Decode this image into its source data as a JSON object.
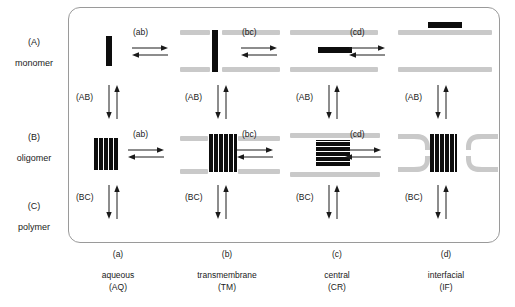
{
  "figure": {
    "colors": {
      "protein": "#0d0d0d",
      "membrane": "#c9c9c9",
      "panel_border": "#9a9a9a",
      "text": "#1a1a1a"
    }
  },
  "rows": [
    {
      "key": "(A)",
      "name": "monomer"
    },
    {
      "key": "(B)",
      "name": "oligomer"
    },
    {
      "key": "(C)",
      "name": "polymer"
    }
  ],
  "columns": [
    {
      "key": "(a)",
      "name": "aqueous",
      "abbr": "(AQ)"
    },
    {
      "key": "(b)",
      "name": "transmembrane",
      "abbr": "(TM)"
    },
    {
      "key": "(c)",
      "name": "central",
      "abbr": "(CR)"
    },
    {
      "key": "(d)",
      "name": "interfacial",
      "abbr": "(IF)"
    }
  ],
  "horizontal_transitions": {
    "monomer_row": [
      "(ab)",
      "(bc)",
      "(cd)"
    ],
    "oligomer_row": [
      "(ab)",
      "(bc)",
      "(cd)"
    ]
  },
  "vertical_transitions": {
    "monomer_to_oligomer": [
      "(AB)",
      "(AB)",
      "(AB)",
      "(AB)"
    ],
    "oligomer_to_polymer": [
      "(BC)",
      "(BC)",
      "(BC)",
      "(BC)"
    ]
  }
}
